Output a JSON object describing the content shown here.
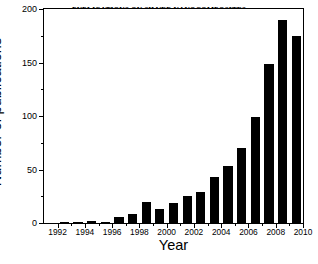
{
  "chart_data": {
    "type": "bar",
    "title": "PUBLICATIONS ON SILVER NANOCOMPOSITES",
    "subtitle": "(ISI WEB OF SCIENCE)",
    "xlabel": "Year",
    "ylabel": "Number of publications",
    "categories": [
      1992,
      1993,
      1994,
      1995,
      1996,
      1997,
      1998,
      1999,
      2000,
      2001,
      2002,
      2003,
      2004,
      2005,
      2006,
      2007,
      2008,
      2009
    ],
    "values": [
      1,
      1,
      2,
      1,
      6,
      8,
      20,
      13,
      19,
      25,
      29,
      43,
      53,
      70,
      99,
      149,
      190,
      175
    ],
    "xlim": [
      1991,
      2010
    ],
    "ylim": [
      0,
      200
    ],
    "x_tick_labels": [
      "1992",
      "1994",
      "1996",
      "1998",
      "2000",
      "2002",
      "2004",
      "2006",
      "2008",
      "2010"
    ],
    "x_tick_values": [
      1992,
      1994,
      1996,
      1998,
      2000,
      2002,
      2004,
      2006,
      2008,
      2010
    ],
    "x_minor_tick_values": [
      1993,
      1995,
      1997,
      1999,
      2001,
      2003,
      2005,
      2007,
      2009
    ],
    "y_tick_labels": [
      "0",
      "50",
      "100",
      "150",
      "200"
    ],
    "y_tick_values": [
      0,
      50,
      100,
      150,
      200
    ],
    "y_minor_tick_values": [
      25,
      75,
      125,
      175
    ],
    "grid": false,
    "legend": null,
    "bar_color": "#000000",
    "axis_color": "#000000",
    "background_color": "#ffffff"
  }
}
